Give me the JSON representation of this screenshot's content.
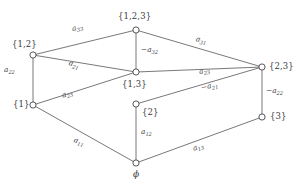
{
  "figure": {
    "line_color": "#55555a",
    "text_color": "#3a3a40",
    "node_fill": "#ffffff"
  },
  "nodes": [
    {
      "id": "top",
      "label": "{1,2,3}",
      "x": 136,
      "y": 30
    },
    {
      "id": "upper_left",
      "label": "{1,2}",
      "x": 33,
      "y": 55
    },
    {
      "id": "upper_right",
      "label": "{2,3}",
      "x": 262,
      "y": 67
    },
    {
      "id": "center",
      "label": "{1,3}",
      "x": 136,
      "y": 72
    },
    {
      "id": "lower_left",
      "label": "{1}",
      "x": 33,
      "y": 105
    },
    {
      "id": "lower_mid",
      "label": "{2}",
      "x": 136,
      "y": 104
    },
    {
      "id": "lower_right",
      "label": "{3}",
      "x": 262,
      "y": 117
    },
    {
      "id": "bottom",
      "label": "ϕ",
      "x": 136,
      "y": 163
    }
  ],
  "edges": [
    {
      "id": "top-upper_left",
      "from": "top",
      "to": "upper_left",
      "label_base": "a",
      "label_sub": "33",
      "negative": false
    },
    {
      "id": "top-upper_right",
      "from": "top",
      "to": "upper_right",
      "label_base": "a",
      "label_sub": "31",
      "negative": false
    },
    {
      "id": "top-center",
      "from": "top",
      "to": "center",
      "label_base": "a",
      "label_sub": "32",
      "negative": true
    },
    {
      "id": "upper_left-center",
      "from": "upper_left",
      "to": "center",
      "label_base": "a",
      "label_sub": "21",
      "negative": false
    },
    {
      "id": "upper_left-lower_left",
      "from": "upper_left",
      "to": "lower_left",
      "label_base": "a",
      "label_sub": "22",
      "negative": false
    },
    {
      "id": "center-upper_right",
      "from": "center",
      "to": "upper_right",
      "label_base": "a",
      "label_sub": "23",
      "negative": false
    },
    {
      "id": "lower_left-center",
      "from": "lower_left",
      "to": "center",
      "label_base": "a",
      "label_sub": "23",
      "negative": false
    },
    {
      "id": "lower_mid-upper_right",
      "from": "lower_mid",
      "to": "upper_right",
      "label_base": "a",
      "label_sub": "21",
      "negative": true
    },
    {
      "id": "upper_right-lower_right",
      "from": "upper_right",
      "to": "lower_right",
      "label_base": "a",
      "label_sub": "22",
      "negative": true
    },
    {
      "id": "lower_mid-bottom",
      "from": "lower_mid",
      "to": "bottom",
      "label_base": "a",
      "label_sub": "12",
      "negative": false
    },
    {
      "id": "lower_left-bottom",
      "from": "lower_left",
      "to": "bottom",
      "label_base": "a",
      "label_sub": "11",
      "negative": false
    },
    {
      "id": "bottom-lower_right",
      "from": "bottom",
      "to": "lower_right",
      "label_base": "a",
      "label_sub": "13",
      "negative": false
    }
  ],
  "edge_labels": {
    "a33": {
      "base": "a",
      "sub": "33",
      "sign": ""
    },
    "a31": {
      "base": "a",
      "sub": "31",
      "sign": ""
    },
    "na32": {
      "base": "a",
      "sub": "32",
      "sign": "−"
    },
    "a21": {
      "base": "a",
      "sub": "21",
      "sign": ""
    },
    "a22": {
      "base": "a",
      "sub": "22",
      "sign": ""
    },
    "a23t": {
      "base": "a",
      "sub": "23",
      "sign": ""
    },
    "a23b": {
      "base": "a",
      "sub": "23",
      "sign": ""
    },
    "na21": {
      "base": "a",
      "sub": "21",
      "sign": "−"
    },
    "na22": {
      "base": "a",
      "sub": "22",
      "sign": "−"
    },
    "a12": {
      "base": "a",
      "sub": "12",
      "sign": ""
    },
    "a11": {
      "base": "a",
      "sub": "11",
      "sign": ""
    },
    "a13": {
      "base": "a",
      "sub": "13",
      "sign": ""
    }
  },
  "node_labels": {
    "top": "{1,2,3}",
    "upper_left": "{1,2}",
    "upper_right": "{2,3}",
    "center": "{1,3}",
    "lower_left": "{1}",
    "lower_mid": "{2}",
    "lower_right": "{3}",
    "bottom": "ϕ"
  }
}
